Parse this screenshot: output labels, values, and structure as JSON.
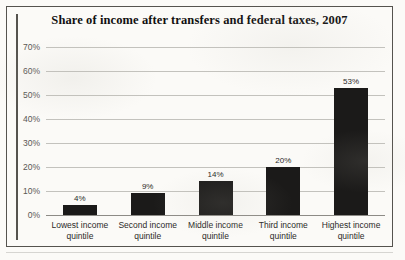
{
  "chart_data": {
    "type": "bar",
    "title": "Share of income after transfers and federal taxes, 2007",
    "xlabel": "",
    "ylabel": "",
    "ylim": [
      0,
      70
    ],
    "grid": true,
    "legend": "none",
    "categories": [
      "Lowest income quintile",
      "Second income quintile",
      "Middle income quintile",
      "Third income quintile",
      "Highest income quintile"
    ],
    "category_lines": [
      [
        "Lowest income",
        "quintile"
      ],
      [
        "Second income",
        "quintile"
      ],
      [
        "Middle income",
        "quintile"
      ],
      [
        "Third income",
        "quintile"
      ],
      [
        "Highest income",
        "quintile"
      ]
    ],
    "values": [
      4,
      9,
      14,
      20,
      53
    ],
    "value_labels": [
      "4%",
      "9%",
      "14%",
      "20%",
      "53%"
    ],
    "ytick_values": [
      0,
      10,
      20,
      30,
      40,
      50,
      60,
      70
    ],
    "ytick_labels": [
      "0%",
      "10%",
      "20%",
      "30%",
      "40%",
      "50%",
      "60%",
      "70%"
    ],
    "colors": {
      "bar": "#1b1a19",
      "gridline": "#c3c2bd",
      "axis": "#55534e",
      "title_text": "#111010",
      "tick_text": "#595754",
      "category_text": "#2b2a28",
      "value_text": "#2a2927",
      "background": "#fbfaf7"
    }
  }
}
